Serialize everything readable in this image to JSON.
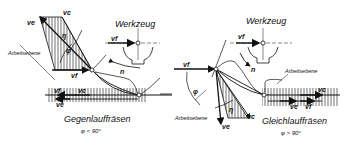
{
  "left": {
    "title": "Gegenlauffräsen",
    "condition": "φ < 90°",
    "tool_label": "Werkzeug",
    "plane_label": "Arbeitsebene",
    "symbols": {
      "ve": "ve",
      "vc": "vc",
      "vf": "vf",
      "eta": "η",
      "phi": "φ",
      "n": "n",
      "vf_tool": "vf",
      "vc_bottom": "vc",
      "vf_bottom": "vf",
      "ve_bottom": "ve"
    }
  },
  "right": {
    "title": "Gleichlauffräsen",
    "condition": "φ > 90°",
    "tool_label": "Werkzeug",
    "plane_label_top": "Arbeitsebene",
    "plane_label_left": "Arbeitsebene",
    "symbols": {
      "vf": "vf",
      "ve": "ve",
      "vc": "vc",
      "eta": "η",
      "phi": "φ",
      "n": "n",
      "vf_tool": "vf",
      "vc_right": "vc",
      "ve_right": "ve",
      "vf_right": "vf"
    }
  },
  "colors": {
    "ink": "#111111",
    "background": "#ffffff"
  }
}
